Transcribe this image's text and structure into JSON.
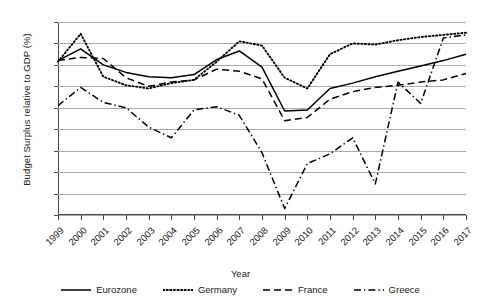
{
  "chart_data": {
    "type": "line",
    "title": "",
    "xlabel": "Year",
    "ylabel": "Budget Surplus relative to GDP (%)",
    "x": [
      1999,
      2000,
      2001,
      2002,
      2003,
      2004,
      2005,
      2006,
      2007,
      2008,
      2009,
      2010,
      2011,
      2012,
      2013,
      2014,
      2015,
      2016,
      2017
    ],
    "xticklabels": [
      "1999",
      "2000",
      "2001",
      "2002",
      "2003",
      "2004",
      "2005",
      "2006",
      "2007",
      "2008",
      "2009",
      "2010",
      "2011",
      "2012",
      "2013",
      "2014",
      "2015",
      "2016",
      "2017"
    ],
    "yticklabels": [
      "2",
      "0",
      "-2",
      "-4",
      "-6",
      "-8",
      "-10",
      "-12",
      "-14",
      "-16"
    ],
    "yticks": [
      2,
      0,
      -2,
      -4,
      -6,
      -8,
      -10,
      -12,
      -14,
      -16
    ],
    "ylim": [
      -16,
      2
    ],
    "xlim": [
      1999,
      2017
    ],
    "grid": "horizontal",
    "legend_position": "bottom",
    "series": [
      {
        "name": "Eurozone",
        "style": "solid",
        "color": "#000000",
        "values": [
          -1.6,
          -0.5,
          -2.0,
          -2.7,
          -3.1,
          -3.2,
          -2.9,
          -1.5,
          -0.7,
          -2.2,
          -6.3,
          -6.2,
          -4.2,
          -3.7,
          -3.1,
          -2.6,
          -2.1,
          -1.6,
          -1.0
        ]
      },
      {
        "name": "Germany",
        "style": "dotted",
        "color": "#000000",
        "values": [
          -1.7,
          0.9,
          -3.1,
          -3.9,
          -4.2,
          -3.7,
          -3.4,
          -1.7,
          0.2,
          -0.2,
          -3.2,
          -4.2,
          -1.0,
          0.0,
          -0.1,
          0.3,
          0.6,
          0.8,
          1.0
        ]
      },
      {
        "name": "France",
        "style": "dashed",
        "color": "#000000",
        "values": [
          -1.6,
          -1.3,
          -1.4,
          -3.2,
          -4.0,
          -3.6,
          -3.4,
          -2.4,
          -2.6,
          -3.3,
          -7.2,
          -6.9,
          -5.2,
          -4.5,
          -4.1,
          -3.9,
          -3.6,
          -3.4,
          -2.8
        ]
      },
      {
        "name": "Greece",
        "style": "dashdot",
        "color": "#000000",
        "values": [
          -5.8,
          -4.1,
          -5.5,
          -6.0,
          -7.8,
          -8.8,
          -6.2,
          -5.9,
          -6.7,
          -10.2,
          -15.4,
          -11.2,
          -10.3,
          -8.8,
          -13.1,
          -3.6,
          -5.6,
          0.5,
          0.8
        ]
      }
    ]
  }
}
